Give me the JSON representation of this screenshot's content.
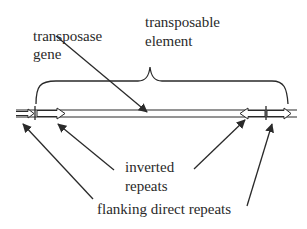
{
  "diagram": {
    "title": "",
    "colors": {
      "line": "#2a2a2a",
      "text": "#2a2a2a",
      "background": "#ffffff"
    },
    "labels": {
      "transposase_gene": {
        "line1": "transposase",
        "line2": "gene"
      },
      "transposable_element": {
        "line1": "transposable",
        "line2": "element"
      },
      "inverted_repeats": {
        "line1": "inverted",
        "line2": "repeats"
      },
      "flanking_direct_repeats": {
        "text": "flanking direct repeats"
      }
    },
    "elements": [
      {
        "id": "dna-strand",
        "type": "double-line",
        "desc": "host DNA"
      },
      {
        "id": "left-flanking-direct-repeat",
        "type": "arrow-box",
        "direction": "right"
      },
      {
        "id": "left-inverted-repeat",
        "type": "arrow-box",
        "direction": "right"
      },
      {
        "id": "right-inverted-repeat",
        "type": "arrow-box",
        "direction": "left"
      },
      {
        "id": "right-flanking-direct-repeat",
        "type": "arrow-box",
        "direction": "right"
      },
      {
        "id": "transposable-element-brace",
        "type": "curly-brace"
      }
    ],
    "pointers": [
      {
        "from": "transposase_gene",
        "to": "element body"
      },
      {
        "from": "inverted_repeats",
        "to": "left-inverted-repeat"
      },
      {
        "from": "inverted_repeats",
        "to": "right-inverted-repeat"
      },
      {
        "from": "flanking_direct_repeats",
        "to": "left-flanking-direct-repeat"
      },
      {
        "from": "flanking_direct_repeats",
        "to": "right-flanking-direct-repeat"
      }
    ]
  }
}
